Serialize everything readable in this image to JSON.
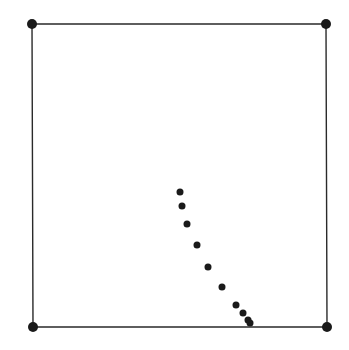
{
  "diagram": {
    "colors": {
      "stroke": "#2a2a2a",
      "dot": "#1a1a1a",
      "background": "#ffffff"
    },
    "square": {
      "corners": [
        {
          "name": "top-left",
          "x": 32,
          "y": 24
        },
        {
          "name": "top-right",
          "x": 326,
          "y": 24
        },
        {
          "name": "bottom-right",
          "x": 327,
          "y": 327
        },
        {
          "name": "bottom-left",
          "x": 33,
          "y": 327
        }
      ],
      "corner_radius": 5,
      "stroke_width": 1.4
    },
    "path_points": {
      "radius": 3.5,
      "points": [
        {
          "x": 180,
          "y": 192
        },
        {
          "x": 182,
          "y": 206
        },
        {
          "x": 187,
          "y": 224
        },
        {
          "x": 197,
          "y": 245
        },
        {
          "x": 208,
          "y": 267
        },
        {
          "x": 222,
          "y": 287
        },
        {
          "x": 236,
          "y": 305
        },
        {
          "x": 243,
          "y": 313
        },
        {
          "x": 248,
          "y": 320
        },
        {
          "x": 250,
          "y": 323
        }
      ]
    }
  }
}
